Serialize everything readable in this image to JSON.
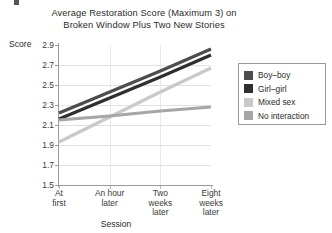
{
  "chart_data": {
    "type": "line",
    "title": "Average Restoration Score (Maximum 3) on Broken Window Plus Two New Stories",
    "title_line1": "Average Restoration Score (Maximum 3) on",
    "title_line2": "Broken Window Plus Two New Stories",
    "xlabel": "Session",
    "ylabel": "Score",
    "categories": [
      "At first",
      "An hour later",
      "Two weeks later",
      "Eight weeks later"
    ],
    "category_lines": [
      [
        "At",
        "first"
      ],
      [
        "An hour",
        "later"
      ],
      [
        "Two",
        "weeks",
        "later"
      ],
      [
        "Eight",
        "weeks",
        "later"
      ]
    ],
    "ylim": [
      1.5,
      2.9
    ],
    "yticks": [
      "2.9",
      "2.7",
      "2.5",
      "2.3",
      "2.1",
      "1.9",
      "1.7",
      "1.5"
    ],
    "ytick_values": [
      2.9,
      2.7,
      2.5,
      2.3,
      2.1,
      1.9,
      1.7,
      1.5
    ],
    "grid": true,
    "legend_position": "right",
    "series": [
      {
        "name": "Boy–boy",
        "color": "#4d4d4d",
        "values": [
          2.22,
          2.43,
          2.64,
          2.86
        ]
      },
      {
        "name": "Girl–girl",
        "color": "#2f2f2f",
        "values": [
          2.16,
          2.37,
          2.58,
          2.8
        ]
      },
      {
        "name": "Mixed sex",
        "color": "#c9c9c9",
        "values": [
          1.93,
          2.18,
          2.43,
          2.67
        ]
      },
      {
        "name": "No interaction",
        "color": "#a6a6a6",
        "values": [
          2.15,
          2.19,
          2.24,
          2.28
        ]
      }
    ]
  },
  "legend": {
    "items": [
      {
        "label": "Boy–boy",
        "color": "#4d4d4d"
      },
      {
        "label": "Girl–girl",
        "color": "#2f2f2f"
      },
      {
        "label": "Mixed sex",
        "color": "#c9c9c9"
      },
      {
        "label": "No interaction",
        "color": "#a6a6a6"
      }
    ]
  }
}
